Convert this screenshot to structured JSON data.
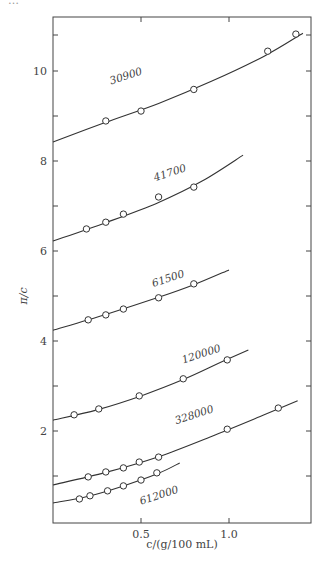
{
  "caption_fragment": "…",
  "chart_data": {
    "type": "line",
    "title": "",
    "xlabel": "c/(g/100 mL)",
    "ylabel": "π/c",
    "xlim": [
      0,
      1.47
    ],
    "ylim": [
      0,
      11.3
    ],
    "x_ticks": [
      {
        "value": 0.5,
        "label": "0.5"
      },
      {
        "value": 1.0,
        "label": "1.0"
      }
    ],
    "y_ticks": [
      {
        "value": 2,
        "label": "2"
      },
      {
        "value": 4,
        "label": "4"
      },
      {
        "value": 6,
        "label": "6"
      },
      {
        "value": 8,
        "label": "8"
      },
      {
        "value": 10,
        "label": "10"
      }
    ],
    "y_minor_ticks": [
      1,
      3,
      5,
      7,
      9,
      10.8
    ],
    "grid": false,
    "legend": "inline labels on curves",
    "series": [
      {
        "name": "30900",
        "points": [
          [
            0.3,
            8.89
          ],
          [
            0.5,
            9.11
          ],
          [
            0.8,
            9.59
          ],
          [
            1.22,
            10.44
          ],
          [
            1.38,
            10.82
          ]
        ],
        "fit": [
          [
            0,
            8.42
          ],
          [
            0.3,
            8.86
          ],
          [
            0.6,
            9.28
          ],
          [
            0.9,
            9.77
          ],
          [
            1.2,
            10.33
          ],
          [
            1.42,
            10.84
          ]
        ],
        "label_pos": [
          0.33,
          9.7,
          -18
        ]
      },
      {
        "name": "41700",
        "points": [
          [
            0.19,
            6.49
          ],
          [
            0.3,
            6.64
          ],
          [
            0.4,
            6.82
          ],
          [
            0.6,
            7.2
          ],
          [
            0.8,
            7.42
          ]
        ],
        "fit": [
          [
            0,
            6.22
          ],
          [
            0.3,
            6.63
          ],
          [
            0.6,
            7.08
          ],
          [
            0.85,
            7.56
          ],
          [
            1.08,
            8.13
          ]
        ],
        "label_pos": [
          0.58,
          7.55,
          -18
        ]
      },
      {
        "name": "61500",
        "points": [
          [
            0.2,
            4.47
          ],
          [
            0.3,
            4.58
          ],
          [
            0.4,
            4.71
          ],
          [
            0.6,
            4.96
          ],
          [
            0.8,
            5.27
          ]
        ],
        "fit": [
          [
            0,
            4.24
          ],
          [
            0.3,
            4.59
          ],
          [
            0.6,
            4.97
          ],
          [
            0.8,
            5.25
          ],
          [
            1.0,
            5.58
          ]
        ],
        "label_pos": [
          0.57,
          5.2,
          -18
        ]
      },
      {
        "name": "120000",
        "points": [
          [
            0.12,
            2.36
          ],
          [
            0.26,
            2.49
          ],
          [
            0.49,
            2.78
          ],
          [
            0.74,
            3.16
          ],
          [
            0.99,
            3.58
          ]
        ],
        "fit": [
          [
            0,
            2.24
          ],
          [
            0.25,
            2.47
          ],
          [
            0.5,
            2.78
          ],
          [
            0.75,
            3.16
          ],
          [
            0.95,
            3.52
          ],
          [
            1.11,
            3.8
          ]
        ],
        "label_pos": [
          0.74,
          3.5,
          -18
        ]
      },
      {
        "name": "328000",
        "points": [
          [
            0.2,
            0.98
          ],
          [
            0.3,
            1.09
          ],
          [
            0.4,
            1.18
          ],
          [
            0.49,
            1.31
          ],
          [
            0.6,
            1.42
          ],
          [
            0.99,
            2.04
          ],
          [
            1.28,
            2.51
          ]
        ],
        "fit": [
          [
            0,
            0.8
          ],
          [
            0.3,
            1.08
          ],
          [
            0.6,
            1.43
          ],
          [
            0.9,
            1.88
          ],
          [
            1.2,
            2.36
          ],
          [
            1.39,
            2.67
          ]
        ],
        "label_pos": [
          0.7,
          2.15,
          -18
        ]
      },
      {
        "name": "612000",
        "points": [
          [
            0.15,
            0.49
          ],
          [
            0.21,
            0.56
          ],
          [
            0.31,
            0.67
          ],
          [
            0.4,
            0.78
          ],
          [
            0.5,
            0.91
          ],
          [
            0.59,
            1.07
          ]
        ],
        "fit": [
          [
            0,
            0.4
          ],
          [
            0.2,
            0.55
          ],
          [
            0.4,
            0.78
          ],
          [
            0.6,
            1.06
          ],
          [
            0.72,
            1.29
          ]
        ],
        "label_pos": [
          0.5,
          0.36,
          -18
        ]
      }
    ]
  }
}
